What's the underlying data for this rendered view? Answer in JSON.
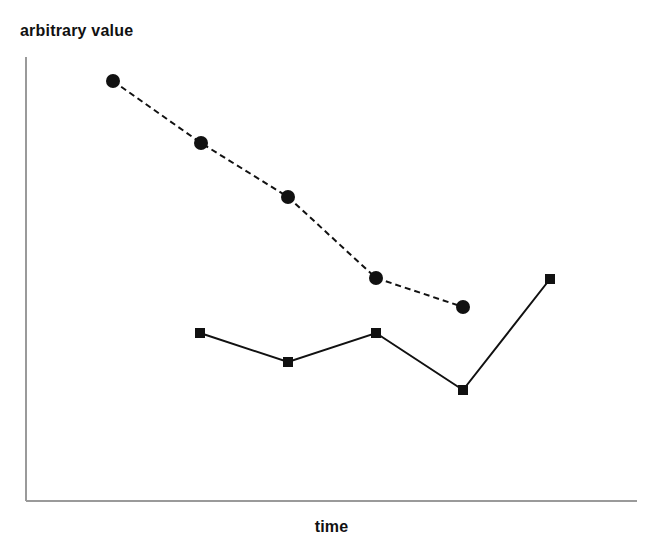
{
  "figure": {
    "width": 663,
    "height": 560,
    "background": "#ffffff"
  },
  "axes": {
    "color": "#9a9a9a",
    "line_width": 1.6,
    "x_label": "time",
    "y_label": "arbitrary value",
    "origin_x": 26,
    "origin_y": 501,
    "x_end": 637,
    "y_top": 57,
    "ticks_visible": false,
    "tick_labels_visible": false,
    "grid": false
  },
  "chart_data": {
    "type": "line",
    "title": "",
    "subtitle": "",
    "xlabel": "time",
    "ylabel": "arbitrary value",
    "grid": false,
    "legend": null,
    "legend_position": "none",
    "axis_ticks": [],
    "xlim": [
      0,
      6
    ],
    "ylim": [
      0,
      10
    ],
    "note": "Unlabeled schematic plot: axes carry no numeric ticks. Values below are read off pixel positions and normalized to a 0-10 arbitrary scale where 10 is the top of the y-axis and 0 is the x-axis baseline.",
    "x": [
      1,
      2,
      3,
      4,
      5,
      6
    ],
    "series": [
      {
        "name": "dashed-circle-series",
        "marker": "circle",
        "marker_size": 14,
        "line_style": "dashed",
        "dash_pattern": [
          6,
          4
        ],
        "color": "#111111",
        "line_width": 2,
        "x": [
          1,
          2,
          3,
          4,
          5
        ],
        "values": [
          9.5,
          8.1,
          6.8,
          5.0,
          4.4
        ],
        "pixel_points": [
          [
            113,
            81
          ],
          [
            201,
            143
          ],
          [
            288,
            197
          ],
          [
            376,
            278
          ],
          [
            463,
            307
          ]
        ]
      },
      {
        "name": "solid-square-series",
        "marker": "square",
        "marker_size": 10,
        "line_style": "solid",
        "dash_pattern": [],
        "color": "#111111",
        "line_width": 2,
        "x": [
          2,
          3,
          4,
          5,
          6
        ],
        "values": [
          3.8,
          3.1,
          3.8,
          2.5,
          5.0
        ],
        "pixel_points": [
          [
            200,
            333
          ],
          [
            288,
            362
          ],
          [
            376,
            333
          ],
          [
            463,
            390
          ],
          [
            550,
            279
          ]
        ]
      }
    ]
  }
}
